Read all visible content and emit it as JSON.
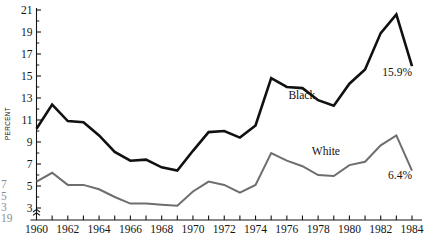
{
  "chart_data": {
    "type": "line",
    "title": "",
    "xlabel": "",
    "ylabel": "PERCENT",
    "xlim": [
      1960,
      1984
    ],
    "ylim": [
      3,
      21
    ],
    "yticks": [
      3,
      5,
      7,
      9,
      11,
      13,
      15,
      17,
      19,
      21
    ],
    "ytick_labels": [
      "3",
      "5",
      "7",
      "9",
      "11",
      "13",
      "15",
      "17",
      "19",
      "21"
    ],
    "xticks": [
      1960,
      1961,
      1962,
      1963,
      1964,
      1965,
      1966,
      1967,
      1968,
      1969,
      1970,
      1971,
      1972,
      1973,
      1974,
      1975,
      1976,
      1977,
      1978,
      1979,
      1980,
      1981,
      1982,
      1983,
      1984
    ],
    "xtick_labels": [
      "1960",
      "1962",
      "1964",
      "1966",
      "1968",
      "1970",
      "1972",
      "1974",
      "1976",
      "1978",
      "1980",
      "1982",
      "1984"
    ],
    "xtick_label_years": [
      1960,
      1962,
      1964,
      1966,
      1968,
      1970,
      1972,
      1974,
      1976,
      1978,
      1980,
      1982,
      1984
    ],
    "grid": false,
    "legend_position": "inline-annotation",
    "y_axis_break": true,
    "x": [
      1960,
      1961,
      1962,
      1963,
      1964,
      1965,
      1966,
      1967,
      1968,
      1969,
      1970,
      1971,
      1972,
      1973,
      1974,
      1975,
      1976,
      1977,
      1978,
      1979,
      1980,
      1981,
      1982,
      1983,
      1984
    ],
    "series": [
      {
        "name": "Black",
        "color": "#111111",
        "width": 2.6,
        "label_text": "Black",
        "end_label": "15.9%",
        "values": [
          10.2,
          12.4,
          10.9,
          10.8,
          9.6,
          8.1,
          7.3,
          7.4,
          6.7,
          6.4,
          8.2,
          9.9,
          10.0,
          9.4,
          10.5,
          14.8,
          14.0,
          13.9,
          12.8,
          12.3,
          14.3,
          15.6,
          18.9,
          20.6,
          15.9
        ]
      },
      {
        "name": "White",
        "color": "#6e6e6e",
        "width": 2.0,
        "label_text": "White",
        "end_label": "6.4%",
        "values": [
          5.4,
          6.2,
          5.1,
          5.1,
          4.7,
          4.0,
          3.4,
          3.4,
          3.3,
          3.2,
          4.5,
          5.4,
          5.1,
          4.4,
          5.1,
          8.0,
          7.3,
          6.8,
          6.0,
          5.9,
          6.9,
          7.2,
          8.7,
          9.6,
          6.4
        ]
      }
    ],
    "annotations": [
      {
        "text": "Black",
        "x": 1976.1,
        "y": 12.9,
        "anchor": "start"
      },
      {
        "text": "White",
        "x": 1977.6,
        "y": 7.8,
        "anchor": "start"
      },
      {
        "text": "15.9%",
        "x": 1984.0,
        "y": 15.0,
        "anchor": "end"
      },
      {
        "text": "6.4%",
        "x": 1984.0,
        "y": 5.6,
        "anchor": "end"
      }
    ],
    "edge_fragments": [
      "7",
      "5",
      "3",
      "19"
    ]
  }
}
